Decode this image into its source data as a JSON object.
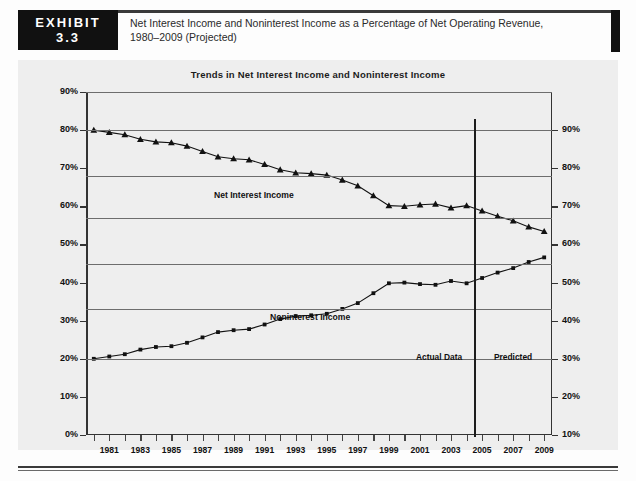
{
  "exhibit": {
    "word": "EXHIBIT",
    "number": "3.3",
    "caption_line1": "Net Interest Income and Noninterest Income as a Percentage of Net Operating Revenue,",
    "caption_line2": "1980–2009 (Projected)"
  },
  "annotations": {
    "actual_data": "Actual Data",
    "predicted": "Predicted",
    "series1_label": "Net Interest Income",
    "series2_label": "Noninterest Income"
  },
  "colors": {
    "badge_bg": "#111111",
    "chart_bg": "#eeeeee",
    "ink": "#111111",
    "grid": "#6d6d6d"
  },
  "chart_data": {
    "type": "line",
    "title": "Trends in Net Interest Income and Noninterest Income",
    "xlabel": "",
    "ylabel": "",
    "ylim": [
      0,
      90
    ],
    "ylim_right": [
      10,
      90
    ],
    "grid": true,
    "legend": "inline-annotations",
    "yticks_left": [
      "0%",
      "10%",
      "20%",
      "30%",
      "40%",
      "50%",
      "60%",
      "70%",
      "80%",
      "90%"
    ],
    "yticks_right": [
      "10%",
      "20%",
      "30%",
      "40%",
      "50%",
      "60%",
      "70%",
      "80%",
      "90%"
    ],
    "gridline_values_left": [
      20,
      33,
      45,
      57,
      68,
      80,
      90
    ],
    "x": [
      1980,
      1981,
      1982,
      1983,
      1984,
      1985,
      1986,
      1987,
      1988,
      1989,
      1990,
      1991,
      1992,
      1993,
      1994,
      1995,
      1996,
      1997,
      1998,
      1999,
      2000,
      2001,
      2002,
      2003,
      2004,
      2005,
      2006,
      2007,
      2008,
      2009
    ],
    "xtick_labels": [
      "1981",
      "1983",
      "1985",
      "1987",
      "1989",
      "1991",
      "1993",
      "1995",
      "1997",
      "1999",
      "2001",
      "2003",
      "2005",
      "2007",
      "2009"
    ],
    "xtick_label_years": [
      1981,
      1983,
      1985,
      1987,
      1989,
      1991,
      1993,
      1995,
      1997,
      1999,
      2001,
      2003,
      2005,
      2007,
      2009
    ],
    "divider_year": 2004.5,
    "series": [
      {
        "name": "Net Interest Income",
        "marker": "triangle",
        "values": [
          80.0,
          79.4,
          78.8,
          77.6,
          76.9,
          76.7,
          75.8,
          74.4,
          73.0,
          72.5,
          72.2,
          71.0,
          69.6,
          68.8,
          68.6,
          68.2,
          66.9,
          65.4,
          62.8,
          60.2,
          60.0,
          60.4,
          60.6,
          59.6,
          60.2,
          58.8,
          57.4,
          56.2,
          54.6,
          53.4
        ]
      },
      {
        "name": "Noninterest Income",
        "marker": "square",
        "values": [
          20.0,
          20.6,
          21.2,
          22.4,
          23.1,
          23.3,
          24.2,
          25.6,
          27.0,
          27.5,
          27.8,
          29.0,
          30.4,
          31.2,
          31.4,
          31.8,
          33.1,
          34.6,
          37.2,
          39.8,
          40.0,
          39.6,
          39.4,
          40.4,
          39.8,
          41.2,
          42.6,
          43.8,
          45.4,
          46.6
        ]
      }
    ]
  }
}
